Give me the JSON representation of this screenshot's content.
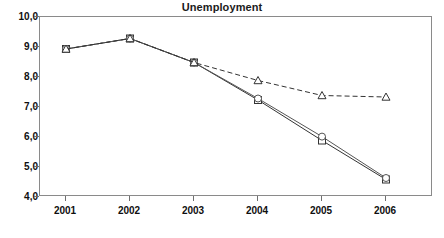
{
  "chart_data": {
    "type": "line",
    "title": "Unemployment",
    "xlabel": "",
    "ylabel": "",
    "categories": [
      "2001",
      "2002",
      "2003",
      "2004",
      "2005",
      "2006"
    ],
    "ylim": [
      4.0,
      10.0
    ],
    "yticks": [
      "4,0",
      "5,0",
      "6,0",
      "7,0",
      "8,0",
      "9,0",
      "10,0"
    ],
    "ytick_values": [
      4.0,
      5.0,
      6.0,
      7.0,
      8.0,
      9.0,
      10.0
    ],
    "grid": false,
    "legend": "none",
    "decimal_separator": ",",
    "series": [
      {
        "name": "series-squares",
        "marker": "square",
        "line_style": "solid",
        "color": "#333333",
        "values": [
          8.9,
          9.25,
          8.45,
          7.2,
          5.85,
          4.55
        ]
      },
      {
        "name": "series-circles",
        "marker": "circle",
        "line_style": "solid",
        "color": "#555555",
        "values": [
          8.9,
          9.25,
          8.45,
          7.25,
          5.98,
          4.6
        ]
      },
      {
        "name": "series-triangles",
        "marker": "triangle",
        "line_style": "dashed",
        "color": "#333333",
        "values": [
          8.9,
          9.25,
          8.45,
          7.85,
          7.35,
          7.3
        ]
      }
    ]
  },
  "axis": {
    "y_labels": [
      "10,0",
      "9,0",
      "8,0",
      "7,0",
      "6,0",
      "5,0",
      "4,0"
    ],
    "x_labels": [
      "2001",
      "2002",
      "2003",
      "2004",
      "2005",
      "2006"
    ]
  }
}
